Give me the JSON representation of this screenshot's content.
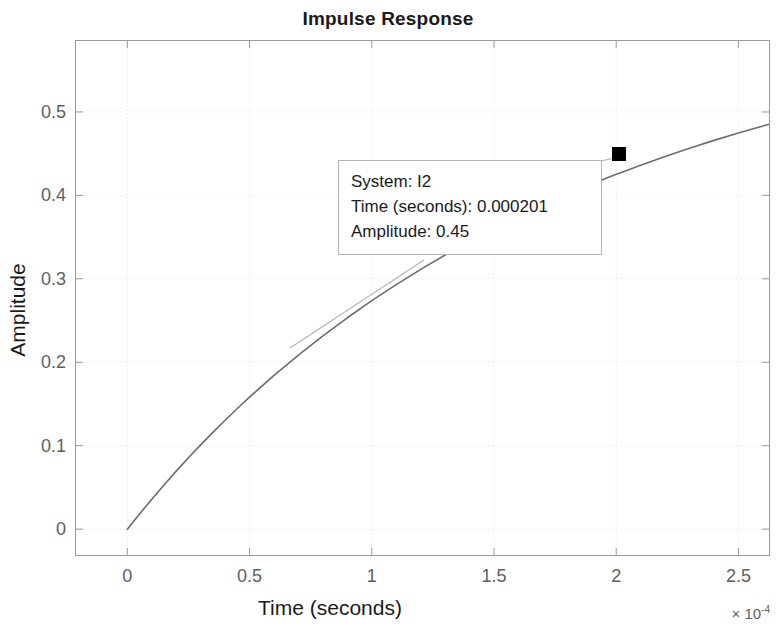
{
  "chart_data": {
    "type": "line",
    "title": "Impulse Response",
    "xlabel": "Time (seconds)",
    "ylabel": "Amplitude",
    "x_exponent_prefix": "× 10",
    "x_exponent_value": "-4",
    "xlim": [
      -0.21,
      2.625
    ],
    "ylim": [
      -0.031,
      0.585
    ],
    "x_ticks": [
      0,
      0.5,
      1,
      1.5,
      2,
      2.5
    ],
    "x_tick_labels": [
      "0",
      "0.5",
      "1",
      "1.5",
      "2",
      "2.5"
    ],
    "y_ticks": [
      0,
      0.1,
      0.2,
      0.3,
      0.4,
      0.5
    ],
    "y_tick_labels": [
      "0",
      "0.1",
      "0.2",
      "0.3",
      "0.4",
      "0.5"
    ],
    "grid": true,
    "legend": null,
    "series": [
      {
        "name": "I2",
        "color": "#6b6b78",
        "x": [
          0.0,
          0.05,
          0.1,
          0.15,
          0.2,
          0.25,
          0.3,
          0.35,
          0.4,
          0.45,
          0.5,
          0.6,
          0.7,
          0.8,
          0.9,
          1.0,
          1.1,
          1.2,
          1.3,
          1.4,
          1.5,
          1.6,
          1.7,
          1.8,
          1.9,
          2.0,
          2.01,
          2.1,
          2.2,
          2.3,
          2.4,
          2.5,
          2.6,
          2.625
        ],
        "y": [
          0.0,
          0.0182,
          0.0359,
          0.053,
          0.0695,
          0.0855,
          0.101,
          0.116,
          0.1305,
          0.1446,
          0.1582,
          0.1842,
          0.2086,
          0.2316,
          0.2533,
          0.2738,
          0.2931,
          0.3113,
          0.3285,
          0.3447,
          0.3601,
          0.3746,
          0.3883,
          0.4013,
          0.4135,
          0.4252,
          0.4262,
          0.4362,
          0.4466,
          0.4565,
          0.4659,
          0.4748,
          0.4832,
          0.4852
        ]
      }
    ],
    "annotation": {
      "kind": "datatip",
      "marker_shape": "square",
      "marker_color": "#000000",
      "point": {
        "x": 2.01,
        "y": 0.45
      },
      "lines": [
        "System: I2",
        "Time (seconds): 0.000201",
        "Amplitude: 0.45"
      ]
    }
  },
  "chart": {
    "title": "Impulse Response",
    "xlabel": "Time (seconds)",
    "ylabel": "Amplitude",
    "exponent_prefix": "× 10",
    "exponent_power": "-4"
  },
  "datatip": {
    "line1": "System: I2",
    "line2": "Time (seconds): 0.000201",
    "line3": "Amplitude: 0.45"
  },
  "colors": {
    "line": "#6b6b78",
    "grid": "#e9e9e9",
    "axis": "#9a9a9a",
    "tick_text": "#5e5e5e",
    "label_text": "#1a1a1a",
    "marker": "#000000",
    "tip_border": "#b4b4b4",
    "background": "#ffffff"
  }
}
